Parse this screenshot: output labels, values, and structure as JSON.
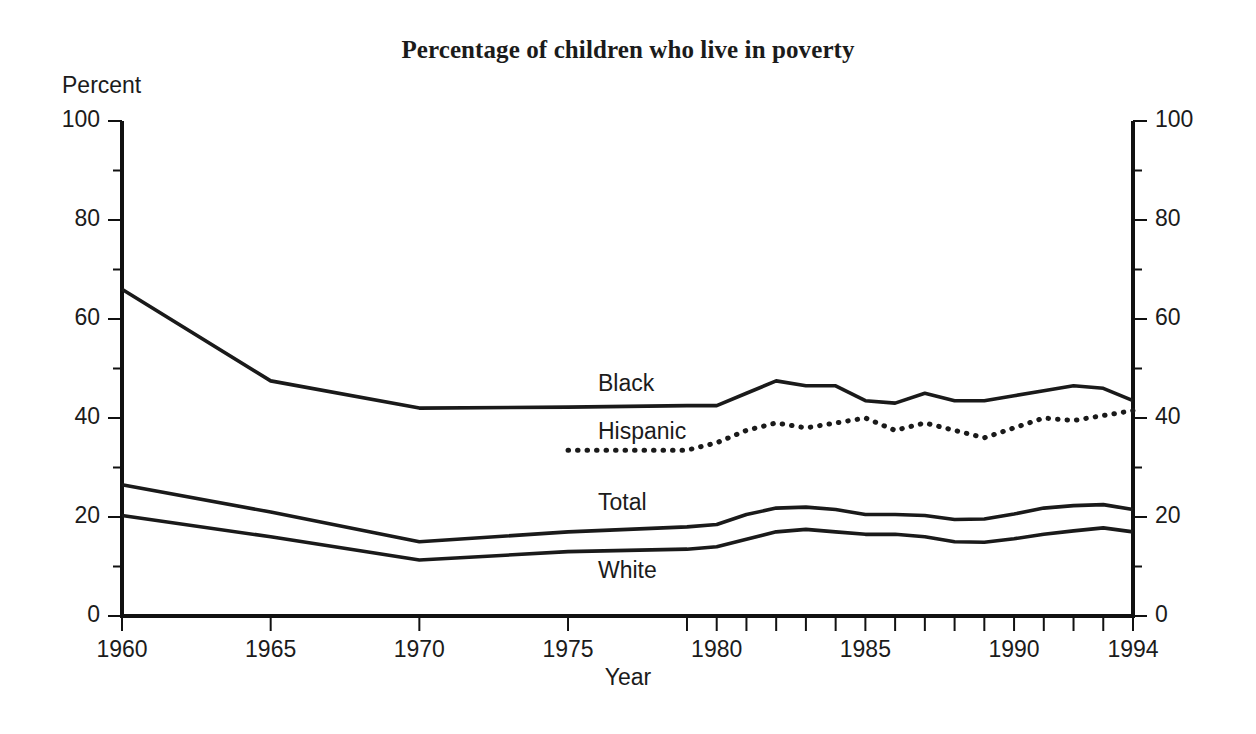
{
  "chart_data": {
    "type": "line",
    "title": "Percentage of children who live in poverty",
    "xlabel": "Year",
    "ylabel": "Percent",
    "ylim": [
      0,
      100
    ],
    "xlim": [
      1960,
      1994
    ],
    "grid": false,
    "legend_position": "inline-labels",
    "y_ticks_major": [
      0,
      20,
      40,
      60,
      80,
      100
    ],
    "y_ticks_minor": [
      10,
      30,
      50,
      70,
      90
    ],
    "y_tick_labels_left": [
      "0",
      "20",
      "40",
      "60",
      "80",
      "100"
    ],
    "y_tick_labels_right": [
      "0",
      "20",
      "40",
      "60",
      "80",
      "100"
    ],
    "x_ticks_major": [
      1960,
      1965,
      1970,
      1975,
      1980,
      1985,
      1990,
      1994
    ],
    "x_tick_labels": [
      "1960",
      "1965",
      "1970",
      "1975",
      "1980",
      "1985",
      "1990",
      "1994"
    ],
    "x_ticks_annual_from": 1979,
    "series": [
      {
        "name": "Black",
        "style": "solid",
        "color": "#1a1a1a",
        "label_x": 1975.4,
        "label_y": 47.5,
        "x": [
          1960,
          1965,
          1970,
          1975,
          1979,
          1980,
          1981,
          1982,
          1983,
          1984,
          1985,
          1986,
          1987,
          1988,
          1989,
          1990,
          1991,
          1992,
          1993,
          1994
        ],
        "y": [
          66.0,
          47.5,
          42.0,
          42.2,
          42.5,
          42.5,
          45.0,
          47.5,
          46.5,
          46.5,
          43.5,
          43.0,
          45.0,
          43.5,
          43.5,
          44.5,
          45.5,
          46.5,
          46.0,
          43.5
        ]
      },
      {
        "name": "Hispanic",
        "style": "dotted",
        "color": "#1a1a1a",
        "label_x": 1975.4,
        "label_y": 37.5,
        "x": [
          1975,
          1979,
          1980,
          1981,
          1982,
          1983,
          1984,
          1985,
          1986,
          1987,
          1988,
          1989,
          1990,
          1991,
          1992,
          1993,
          1994
        ],
        "y": [
          33.5,
          33.5,
          35.0,
          37.5,
          39.0,
          38.0,
          39.0,
          40.0,
          37.5,
          39.0,
          37.5,
          36.0,
          38.0,
          40.0,
          39.5,
          40.5,
          41.5
        ]
      },
      {
        "name": "Total",
        "style": "solid",
        "color": "#1a1a1a",
        "label_x": 1975.4,
        "label_y": 23.0,
        "x": [
          1960,
          1965,
          1970,
          1975,
          1979,
          1980,
          1981,
          1982,
          1983,
          1984,
          1985,
          1986,
          1987,
          1988,
          1989,
          1990,
          1991,
          1992,
          1993,
          1994
        ],
        "y": [
          26.5,
          21.0,
          15.0,
          17.0,
          18.0,
          18.5,
          20.5,
          21.8,
          22.0,
          21.5,
          20.5,
          20.5,
          20.3,
          19.5,
          19.6,
          20.6,
          21.8,
          22.3,
          22.5,
          21.5
        ]
      },
      {
        "name": "White",
        "style": "solid",
        "color": "#1a1a1a",
        "label_x": 1975.4,
        "label_y": 10.5,
        "x": [
          1960,
          1965,
          1970,
          1975,
          1979,
          1980,
          1981,
          1982,
          1983,
          1984,
          1985,
          1986,
          1987,
          1988,
          1989,
          1990,
          1991,
          1992,
          1993,
          1994
        ],
        "y": [
          20.3,
          16.0,
          11.3,
          13.0,
          13.5,
          14.0,
          15.5,
          17.0,
          17.5,
          17.0,
          16.5,
          16.5,
          16.0,
          15.0,
          14.9,
          15.6,
          16.5,
          17.2,
          17.8,
          17.0
        ]
      }
    ]
  },
  "labels": {
    "title": "Percentage of children who live in poverty",
    "ylabel": "Percent",
    "xlabel": "Year",
    "series_black": "Black",
    "series_hispanic": "Hispanic",
    "series_total": "Total",
    "series_white": "White"
  }
}
